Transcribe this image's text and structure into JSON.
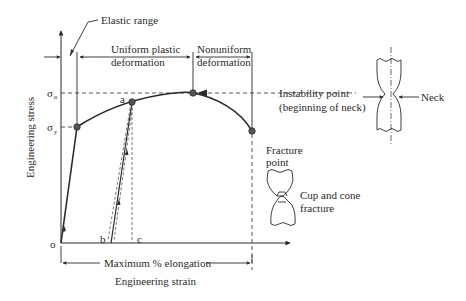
{
  "diagram": {
    "axes": {
      "x_label": "Engineering strain",
      "y_label": "Engineering stress",
      "origin_label": "o"
    },
    "stress_levels": {
      "ultimate": "σu",
      "yield": "σy",
      "ultimate_base": "σ",
      "ultimate_sub": "u",
      "yield_base": "σ",
      "yield_sub": "y"
    },
    "regions": {
      "elastic": "Elastic range",
      "uniform_line1": "Uniform plastic",
      "uniform_line2": "deformation",
      "nonuniform_line1": "Nonuniform",
      "nonuniform_line2": "deformation"
    },
    "points": {
      "a": "a",
      "b": "b",
      "c": "c"
    },
    "annotations": {
      "instability_line1": "Instability point",
      "instability_line2": "(beginning of neck)",
      "neck": "Neck",
      "fracture_point_line1": "Fracture",
      "fracture_point_line2": "point",
      "cup_cone_line1": "Cup and cone",
      "cup_cone_line2": "fracture",
      "max_elongation": "Maximum % elongation"
    },
    "colors": {
      "line": "#2a2a2a",
      "point_fill": "#555555",
      "background": "#ffffff"
    }
  }
}
